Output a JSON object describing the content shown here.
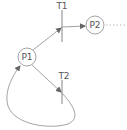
{
  "diagram": {
    "type": "petri-net",
    "places": [
      {
        "id": "P1",
        "label": "P1",
        "cx": 27,
        "cy": 57,
        "r": 9
      },
      {
        "id": "P2",
        "label": "P2",
        "cx": 95,
        "cy": 25,
        "r": 9
      }
    ],
    "transitions": [
      {
        "id": "T1",
        "label": "T1",
        "x": 62,
        "y1": 10,
        "y2": 42
      },
      {
        "id": "T2",
        "label": "T2",
        "x": 62,
        "y1": 80,
        "y2": 104
      }
    ],
    "arcs": [
      {
        "from": "P1",
        "to": "T1"
      },
      {
        "from": "T1",
        "to": "P2"
      },
      {
        "from": "P1",
        "to": "T2"
      },
      {
        "from": "T2",
        "to": "P1"
      }
    ],
    "continuation": "dotted-line-from-P2"
  },
  "colors": {
    "stroke": "#8a8a8a",
    "text": "#555555",
    "background": "#ffffff"
  }
}
